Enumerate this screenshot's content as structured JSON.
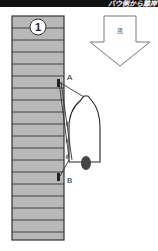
{
  "header": {
    "text": "バウ側から離岸"
  },
  "diagram": {
    "step_number": "1",
    "wind_label": "風",
    "point_a": "A",
    "point_b": "B",
    "colors": {
      "quay_fill": "#b8b8b8",
      "quay_line": "#333333",
      "boat_outline": "#222222",
      "engine": "#444444",
      "fender": "#888888",
      "header_bg": "#111111"
    }
  }
}
